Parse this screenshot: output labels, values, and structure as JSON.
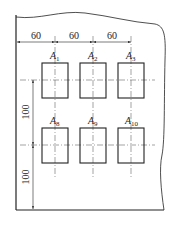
{
  "diagram": {
    "type": "technical-drawing",
    "horizontal_dimensions": [
      {
        "label": "60"
      },
      {
        "label": "60"
      },
      {
        "label": "60"
      }
    ],
    "vertical_dimensions": [
      {
        "label": "100"
      },
      {
        "label": "100"
      }
    ],
    "rows": [
      {
        "cells": [
          {
            "letter": "A",
            "sub": "1"
          },
          {
            "letter": "A",
            "sub": "2"
          },
          {
            "letter": "A",
            "sub": "3"
          }
        ]
      },
      {
        "cells": [
          {
            "letter": "A",
            "sub": "8"
          },
          {
            "letter": "A",
            "sub": "9"
          },
          {
            "letter": "A",
            "sub": "10"
          }
        ]
      }
    ],
    "colors": {
      "line": "#222222",
      "thin_line": "#444444",
      "background": "#ffffff"
    }
  }
}
